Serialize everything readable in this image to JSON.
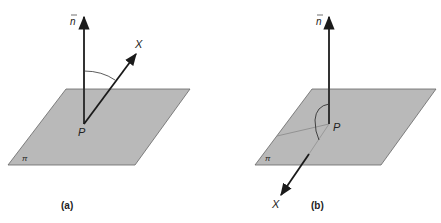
{
  "colors": {
    "plane_fill": "#b9b9b9",
    "plane_stroke": "#666666",
    "vector": "#1a1a1a",
    "hidden_line": "#888888"
  },
  "panels": [
    {
      "caption": "(a)",
      "normal_label": "n",
      "point_label": "P",
      "vector_label": "X",
      "plane_label": "π"
    },
    {
      "caption": "(b)",
      "normal_label": "n",
      "point_label": "P",
      "vector_label": "X",
      "plane_label": "π"
    }
  ]
}
